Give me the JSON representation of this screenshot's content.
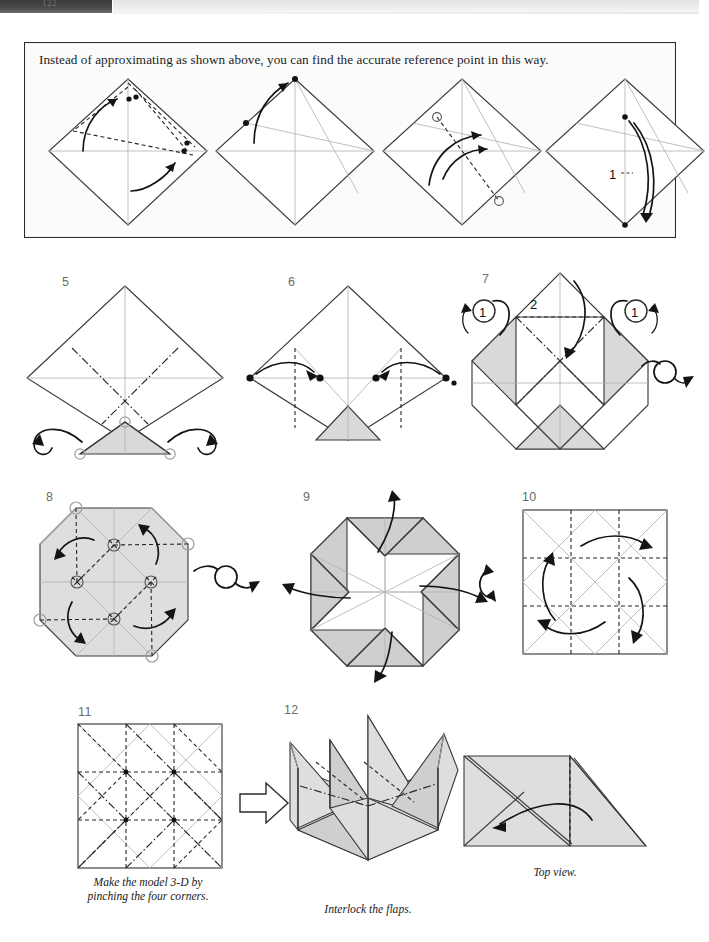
{
  "page": {
    "background_color": "#ffffff",
    "ink_color": "#1a1a1a",
    "shade_color": "#d9d9d9",
    "crease_color": "#b4b4b4",
    "scan_page_number": "122"
  },
  "callout": {
    "text": "Instead of approximating as shown above, you can find the accurate reference point in this way.",
    "border_color": "#2b2b2b",
    "panels": [
      {
        "id": "a",
        "label": "",
        "note": "diamond with dotted reference lines and two curved arrows"
      },
      {
        "id": "b",
        "label": "",
        "note": "diamond with thin creases, arrow to top point"
      },
      {
        "id": "c",
        "label": "",
        "note": "diamond with hollow circles and dotted line, curved arrows"
      },
      {
        "id": "d",
        "label": "1",
        "note": "diamond with repeat symbol 1 and double curved arrow"
      }
    ]
  },
  "steps": [
    {
      "number": "5",
      "caption": "",
      "note": "diamond with mountain creases and small shaded triangle at bottom; two wrap-around arrows at left and right; three hollow reference circles"
    },
    {
      "number": "6",
      "caption": "",
      "note": "diamond with two vertical valley folds and two curved arrows bringing side dots to centre dots; shaded triangle at bottom"
    },
    {
      "number": "7",
      "caption": "",
      "note": "hexagon-like shape with shaded quadrants, repeat symbols labelled 1 at left and right, fold 2 at top, turn-over arrow at the right",
      "labels": [
        "1",
        "2",
        "1"
      ]
    },
    {
      "number": "8",
      "caption": "",
      "note": "shaded octagon with dotted diagonals, circled intersection points and four rotational curved arrows"
    },
    {
      "number": "9",
      "caption": "",
      "note": "shaded octagon pinwheel with four outward arrows; turn-over symbol left and rotate symbol right"
    },
    {
      "number": "10",
      "caption": "",
      "note": "square grid with dashed valley folds and four rotational arrows"
    },
    {
      "number": "11",
      "caption": "Make the model 3-D by\npinching the four corners.",
      "caption_lines": [
        "Make the model 3-D by",
        "pinching the four corners."
      ],
      "note": "square crease pattern with valley and mountain folds"
    },
    {
      "number": "12",
      "caption": "Interlock the flaps.",
      "caption_lines": [
        "Interlock the flaps."
      ],
      "note": "3-D box with four upright pointed flaps"
    }
  ],
  "extra_panel": {
    "caption": "Top view.",
    "note": "flattened top view of two triangles with a curved arrow pointing left"
  },
  "symbols": {
    "turn_over": "turn-over-arrow",
    "rotate": "rotate-arrow",
    "repeat_once": "1",
    "big_hollow_arrow": "hollow-arrow-right"
  }
}
